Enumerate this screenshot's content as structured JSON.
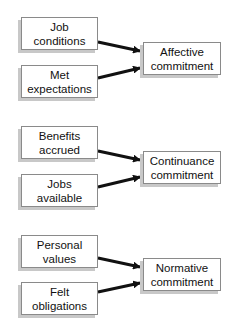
{
  "diagram": {
    "groups": [
      {
        "inputs": [
          {
            "line1": "Job",
            "line2": "conditions"
          },
          {
            "line1": "Met",
            "line2": "expectations"
          }
        ],
        "output": {
          "line1": "Affective",
          "line2": "commitment"
        }
      },
      {
        "inputs": [
          {
            "line1": "Benefits",
            "line2": "accrued"
          },
          {
            "line1": "Jobs",
            "line2": "available"
          }
        ],
        "output": {
          "line1": "Continuance",
          "line2": "commitment"
        }
      },
      {
        "inputs": [
          {
            "line1": "Personal",
            "line2": "values"
          },
          {
            "line1": "Felt",
            "line2": "obligations"
          }
        ],
        "output": {
          "line1": "Normative",
          "line2": "commitment"
        }
      }
    ]
  }
}
